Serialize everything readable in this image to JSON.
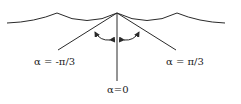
{
  "diagram": {
    "title": "",
    "stroke_color": "#2a2a2a",
    "background": "#ffffff",
    "surface": {
      "type": "cusped-wave",
      "cusps": [
        [
          57,
          13
        ],
        [
          117,
          13
        ],
        [
          177,
          13
        ]
      ],
      "x_range": [
        7,
        225
      ],
      "trough_y": 23
    },
    "rays": [
      {
        "id": "left",
        "from": [
          117,
          13
        ],
        "to": [
          58,
          50
        ],
        "label": "α = -π/3"
      },
      {
        "id": "center",
        "from": [
          117,
          13
        ],
        "to": [
          117,
          81
        ],
        "label": "α=0"
      },
      {
        "id": "right",
        "from": [
          117,
          13
        ],
        "to": [
          176,
          50
        ],
        "label": "α = π/3"
      }
    ],
    "arrows": [
      {
        "id": "left-arc",
        "description": "curved double arrow between α=-π/3 and α=0"
      },
      {
        "id": "right-arc",
        "description": "curved double arrow between α=0 and α=π/3"
      }
    ]
  },
  "labels": {
    "left": "α = -π/3",
    "center": "α=0",
    "right": "α = π/3"
  }
}
